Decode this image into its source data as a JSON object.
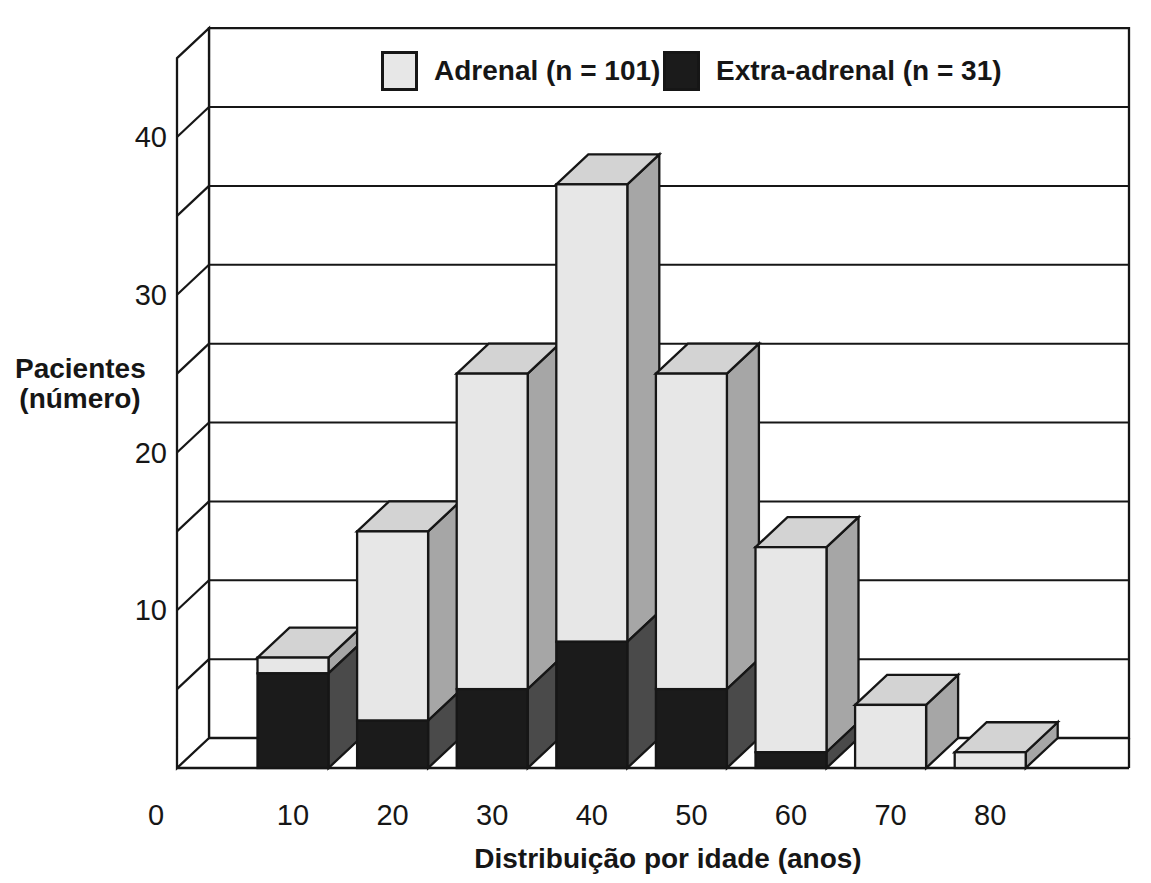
{
  "chart_data": {
    "type": "bar",
    "subtype": "stacked-3d-column",
    "title": "",
    "xlabel": "Distribuição por idade (anos)",
    "ylabel": "Pacientes (número)",
    "ylabel_lines": [
      "Pacientes",
      "(número)"
    ],
    "categories": [
      "10",
      "20",
      "30",
      "40",
      "50",
      "60",
      "70",
      "80"
    ],
    "x_tick_labels": [
      "0",
      "10",
      "20",
      "30",
      "40",
      "50",
      "60",
      "70",
      "80"
    ],
    "y_ticks": [
      10,
      20,
      30,
      40
    ],
    "ylim": [
      0,
      45
    ],
    "grid_step": 5,
    "grid_on": true,
    "legend_position": "top",
    "stack_order_bottom_to_top": [
      "Extra-adrenal",
      "Adrenal"
    ],
    "series": [
      {
        "name": "Extra-adrenal (n = 31)",
        "short_name": "Extra-adrenal",
        "values": [
          6,
          3,
          5,
          8,
          5,
          1,
          0,
          0
        ],
        "color": "#1b1b1b"
      },
      {
        "name": "Adrenal (n = 101)",
        "short_name": "Adrenal",
        "values": [
          1,
          12,
          20,
          29,
          20,
          13,
          4,
          1
        ],
        "color": "#e7e7e7"
      }
    ],
    "stack_totals": [
      7,
      15,
      25,
      37,
      25,
      14,
      4,
      1
    ]
  },
  "legend": {
    "items": [
      {
        "label": "Adrenal (n = 101)",
        "swatch_color": "#e7e7e7"
      },
      {
        "label": "Extra-adrenal (n = 31)",
        "swatch_color": "#1b1b1b"
      }
    ]
  },
  "colors": {
    "outline": "#161616",
    "wall_fill": "#ffffff",
    "adrenal_front": "#e7e7e7",
    "adrenal_top": "#d3d3d3",
    "adrenal_side": "#a6a6a6",
    "extra_front": "#1b1b1b",
    "extra_side": "#4a4a4a",
    "text": "#161616"
  }
}
